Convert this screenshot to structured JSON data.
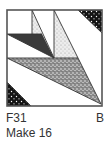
{
  "block": {
    "name": "quilt block diagram",
    "fabrics": {
      "background": "#ffffff",
      "dark": "#3a3a3a",
      "light_stipple": "#e4e4e4",
      "medium_stipple": "#9a9a9a",
      "dark_print": "#151515",
      "outline": "#555555"
    }
  },
  "caption": {
    "code": "F31",
    "label_right": "B",
    "quantity": "Make 16"
  }
}
